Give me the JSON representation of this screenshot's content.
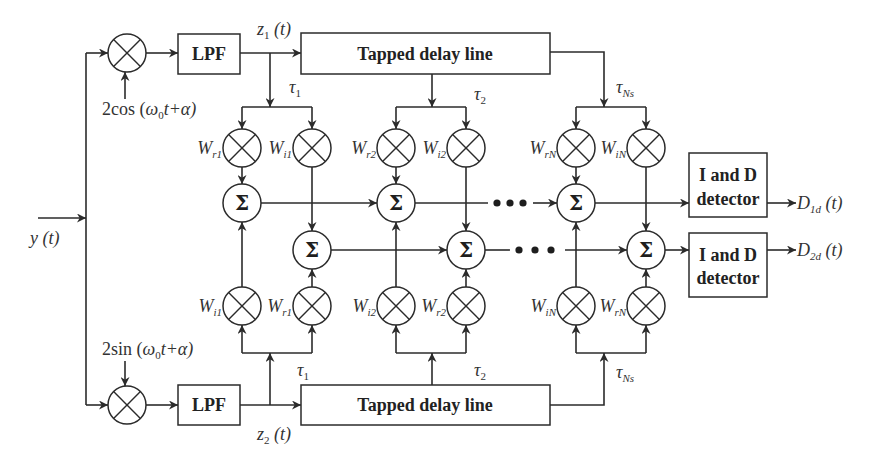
{
  "input_signal": {
    "label": "y (t)"
  },
  "upper_branch": {
    "carrier": {
      "prefix": "2cos (",
      "omega": "ω",
      "omega_sub": "0",
      "suffix": "t+α)"
    },
    "filter_label": "LPF",
    "output": {
      "main": "z",
      "sub": "1",
      "arg": " (t)"
    },
    "delay_line_label": "Tapped delay line",
    "taps": [
      {
        "main": "τ",
        "sub": "1"
      },
      {
        "main": "τ",
        "sub": "2"
      },
      {
        "main": "τ",
        "sub": "Ns"
      }
    ],
    "weights": [
      {
        "main": "W",
        "sub": "r1"
      },
      {
        "main": "W",
        "sub": "i1"
      },
      {
        "main": "W",
        "sub": "r2"
      },
      {
        "main": "W",
        "sub": "i2"
      },
      {
        "main": "W",
        "sub": "rN"
      },
      {
        "main": "W",
        "sub": "iN"
      }
    ]
  },
  "lower_branch": {
    "carrier": {
      "prefix": "2sin (",
      "omega": "ω",
      "omega_sub": "0",
      "suffix": "t+α)"
    },
    "filter_label": "LPF",
    "output": {
      "main": "z",
      "sub": "2",
      "arg": " (t)"
    },
    "delay_line_label": "Tapped delay line",
    "taps": [
      {
        "main": "τ",
        "sub": "1"
      },
      {
        "main": "τ",
        "sub": "2"
      },
      {
        "main": "τ",
        "sub": "Ns"
      }
    ],
    "weights": [
      {
        "main": "W",
        "sub": "i1"
      },
      {
        "main": "W",
        "sub": "r1"
      },
      {
        "main": "W",
        "sub": "i2"
      },
      {
        "main": "W",
        "sub": "r2"
      },
      {
        "main": "W",
        "sub": "iN"
      },
      {
        "main": "W",
        "sub": "rN"
      }
    ]
  },
  "summers": {
    "symbol": "Σ"
  },
  "detectors": [
    {
      "line1": "I and D",
      "line2": "detector",
      "output": {
        "main": "D",
        "sub": "1d",
        "arg": " (t)"
      }
    },
    {
      "line1": "I and D",
      "line2": "detector",
      "output": {
        "main": "D",
        "sub": "2d",
        "arg": " (t)"
      }
    }
  ],
  "colors": {
    "stroke": "#2b2b2b",
    "text": "#222222",
    "background": "#ffffff"
  }
}
